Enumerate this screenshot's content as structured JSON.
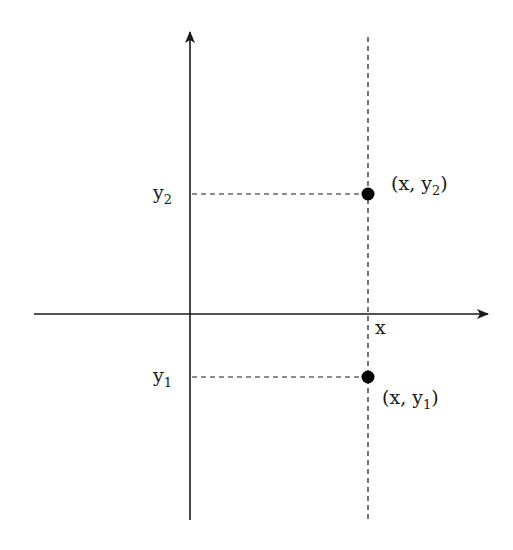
{
  "diagram": {
    "title": "",
    "axes": {
      "x_label": "x",
      "origin": [
        190,
        314
      ],
      "x_axis": {
        "from": [
          34,
          314
        ],
        "to": [
          490,
          314
        ]
      },
      "y_axis": {
        "from": [
          190,
          520
        ],
        "to": [
          190,
          30
        ]
      }
    },
    "vertical_line": {
      "x": 368,
      "from_y": 37,
      "to_y": 520,
      "style": "dashed"
    },
    "points": [
      {
        "id": "p2",
        "label_prefix": "(x, y",
        "label_sub": "2",
        "label_suffix": ")",
        "axis_label": "y",
        "axis_label_sub": "2",
        "center": [
          368,
          194
        ]
      },
      {
        "id": "p1",
        "label_prefix": "(x, y",
        "label_sub": "1",
        "label_suffix": ")",
        "axis_label": "y",
        "axis_label_sub": "1",
        "center": [
          368,
          377
        ]
      }
    ],
    "colors": {
      "ink": "#1a1a1a",
      "point": "#000000",
      "background": "#ffffff"
    }
  }
}
